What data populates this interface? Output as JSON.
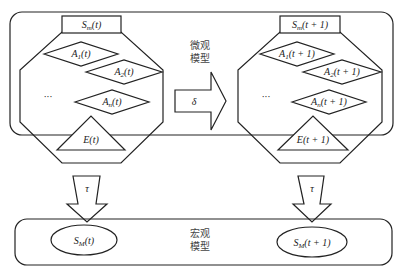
{
  "diagram": {
    "micro_label_line1": "微观",
    "micro_label_line2": "模型",
    "macro_label_line1": "宏观",
    "macro_label_line2": "模型",
    "transition_symbol": "δ",
    "projection_symbol_left": "τ",
    "projection_symbol_right": "τ",
    "state_t": {
      "header": "Sm(t)",
      "agents": [
        "A1(t)",
        "A2(t)",
        "An(t)"
      ],
      "ellipsis": "···",
      "environment": "E(t)"
    },
    "state_t1": {
      "header": "Sm(t + 1)",
      "agents": [
        "A1(t + 1)",
        "A2(t + 1)",
        "An(t + 1)"
      ],
      "ellipsis": "···",
      "environment": "E(t + 1)"
    },
    "macro_t": "SM(t)",
    "macro_t1": "SM(t + 1)"
  }
}
